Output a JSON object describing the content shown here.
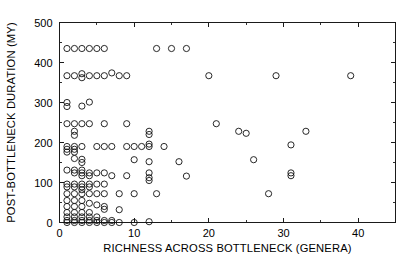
{
  "chart_data": {
    "type": "scatter",
    "title": "",
    "xlabel": "RICHNESS ACROSS BOTTLENECK (GENERA)",
    "ylabel": "POST-BOTTLENECK DURATION (MY)",
    "xlim": [
      0,
      45
    ],
    "ylim": [
      0,
      500
    ],
    "xticks": [
      0,
      10,
      20,
      30,
      40
    ],
    "xticklabels": [
      "0",
      "10",
      "20",
      "30",
      "40"
    ],
    "yticks": [
      0,
      100,
      200,
      300,
      400,
      500
    ],
    "yticklabels": [
      "0",
      "100",
      "200",
      "300",
      "400",
      "500"
    ],
    "xminorticks": [
      5,
      15,
      25,
      35,
      45
    ],
    "yminorticks": [
      50,
      150,
      250,
      350,
      450
    ],
    "grid": false,
    "legend": null,
    "marker": "open-circle",
    "marker_size_px": 3.1,
    "marker_color": "#111111",
    "frame": true,
    "points": [
      [
        1,
        435
      ],
      [
        2,
        435
      ],
      [
        3,
        435
      ],
      [
        4,
        435
      ],
      [
        5,
        435
      ],
      [
        6,
        435
      ],
      [
        13,
        435
      ],
      [
        15,
        435
      ],
      [
        17,
        435
      ],
      [
        1,
        367
      ],
      [
        2,
        367
      ],
      [
        3,
        372
      ],
      [
        3,
        362
      ],
      [
        4,
        367
      ],
      [
        5,
        367
      ],
      [
        6,
        367
      ],
      [
        7,
        374
      ],
      [
        8,
        367
      ],
      [
        9,
        367
      ],
      [
        20,
        367
      ],
      [
        29,
        367
      ],
      [
        39,
        367
      ],
      [
        1,
        300
      ],
      [
        1,
        290
      ],
      [
        3,
        291
      ],
      [
        4,
        301
      ],
      [
        1,
        247
      ],
      [
        2,
        247
      ],
      [
        3,
        247
      ],
      [
        4,
        247
      ],
      [
        6,
        247
      ],
      [
        9,
        247
      ],
      [
        21,
        247
      ],
      [
        2,
        228
      ],
      [
        2,
        218
      ],
      [
        12,
        228
      ],
      [
        12,
        220
      ],
      [
        24,
        228
      ],
      [
        25,
        223
      ],
      [
        33,
        228
      ],
      [
        1,
        190
      ],
      [
        1,
        183
      ],
      [
        1,
        176
      ],
      [
        2,
        190
      ],
      [
        2,
        183
      ],
      [
        2,
        176
      ],
      [
        3,
        190
      ],
      [
        5,
        190
      ],
      [
        6,
        190
      ],
      [
        7,
        190
      ],
      [
        9,
        190
      ],
      [
        10,
        190
      ],
      [
        11,
        190
      ],
      [
        12,
        196
      ],
      [
        12,
        190
      ],
      [
        14,
        190
      ],
      [
        31,
        194
      ],
      [
        2,
        160
      ],
      [
        3,
        158
      ],
      [
        3,
        150
      ],
      [
        10,
        157
      ],
      [
        12,
        152
      ],
      [
        16,
        152
      ],
      [
        26,
        157
      ],
      [
        1,
        131
      ],
      [
        2,
        131
      ],
      [
        2,
        124
      ],
      [
        3,
        131
      ],
      [
        3,
        124
      ],
      [
        3,
        117
      ],
      [
        4,
        124
      ],
      [
        4,
        117
      ],
      [
        5,
        124
      ],
      [
        6,
        124
      ],
      [
        7,
        117
      ],
      [
        9,
        117
      ],
      [
        12,
        124
      ],
      [
        12,
        112
      ],
      [
        12,
        105
      ],
      [
        17,
        116
      ],
      [
        31,
        124
      ],
      [
        31,
        117
      ],
      [
        1,
        96
      ],
      [
        1,
        89
      ],
      [
        2,
        96
      ],
      [
        2,
        89
      ],
      [
        3,
        96
      ],
      [
        3,
        89
      ],
      [
        3,
        82
      ],
      [
        4,
        96
      ],
      [
        4,
        89
      ],
      [
        5,
        96
      ],
      [
        6,
        96
      ],
      [
        1,
        72
      ],
      [
        2,
        72
      ],
      [
        3,
        72
      ],
      [
        4,
        72
      ],
      [
        5,
        72
      ],
      [
        6,
        72
      ],
      [
        8,
        72
      ],
      [
        10,
        72
      ],
      [
        13,
        72
      ],
      [
        28,
        72
      ],
      [
        1,
        55
      ],
      [
        2,
        55
      ],
      [
        3,
        55
      ],
      [
        4,
        48
      ],
      [
        5,
        44
      ],
      [
        6,
        40
      ],
      [
        6,
        33
      ],
      [
        8,
        32
      ],
      [
        1,
        40
      ],
      [
        2,
        40
      ],
      [
        3,
        40
      ],
      [
        1,
        25
      ],
      [
        2,
        25
      ],
      [
        3,
        25
      ],
      [
        4,
        25
      ],
      [
        1,
        14
      ],
      [
        2,
        14
      ],
      [
        3,
        14
      ],
      [
        4,
        14
      ],
      [
        5,
        14
      ],
      [
        1,
        5
      ],
      [
        2,
        5
      ],
      [
        3,
        5
      ],
      [
        4,
        5
      ],
      [
        5,
        5
      ],
      [
        6,
        5
      ],
      [
        7,
        5
      ],
      [
        1,
        0
      ],
      [
        2,
        0
      ],
      [
        3,
        0
      ],
      [
        4,
        0
      ],
      [
        5,
        0
      ],
      [
        6,
        0
      ],
      [
        7,
        0
      ],
      [
        8,
        0
      ],
      [
        10,
        0
      ],
      [
        12,
        2
      ]
    ]
  }
}
